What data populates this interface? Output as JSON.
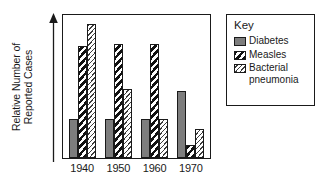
{
  "chart_data": {
    "type": "bar",
    "title": "",
    "xlabel": "",
    "ylabel": "Relative Number of\nReported Cases",
    "ylabel_line1": "Relative Number of",
    "ylabel_line2": "Reported Cases",
    "categories": [
      "1940",
      "1950",
      "1960",
      "1970"
    ],
    "series": [
      {
        "name": "Diabetes",
        "values": [
          0.27,
          0.27,
          0.27,
          0.47
        ]
      },
      {
        "name": "Measles",
        "values": [
          0.78,
          0.8,
          0.8,
          0.09
        ]
      },
      {
        "name": "Bacterial pneumonia",
        "values": [
          0.94,
          0.48,
          0.27,
          0.2
        ]
      }
    ],
    "ylim": [
      0,
      1
    ],
    "y_axis_ticks": [],
    "grid": false,
    "legend_position": "right",
    "axis_arrow": "up"
  },
  "legend": {
    "title": "Key",
    "entries": [
      {
        "label": "Diabetes",
        "swatch": "solid-gray-swatch",
        "color": "#7d7d7d"
      },
      {
        "label": "Measles",
        "swatch": "bold-diagonal-hatch-swatch",
        "color": "#111111"
      },
      {
        "label": "Bacterial\npneumonia",
        "swatch": "fine-diagonal-hatch-swatch",
        "color": "#3d3d3d"
      }
    ]
  },
  "axis": {
    "x_tick_labels": [
      "1940",
      "1950",
      "1960",
      "1970"
    ],
    "y_title_line1": "Relative Number of",
    "y_title_line2": "Reported Cases"
  },
  "colors": {
    "ink": "#1a1a1a",
    "background": "#ffffff",
    "diabetes": "#7d7d7d",
    "measles": "#111111",
    "bacterial": "#3d3d3d"
  }
}
